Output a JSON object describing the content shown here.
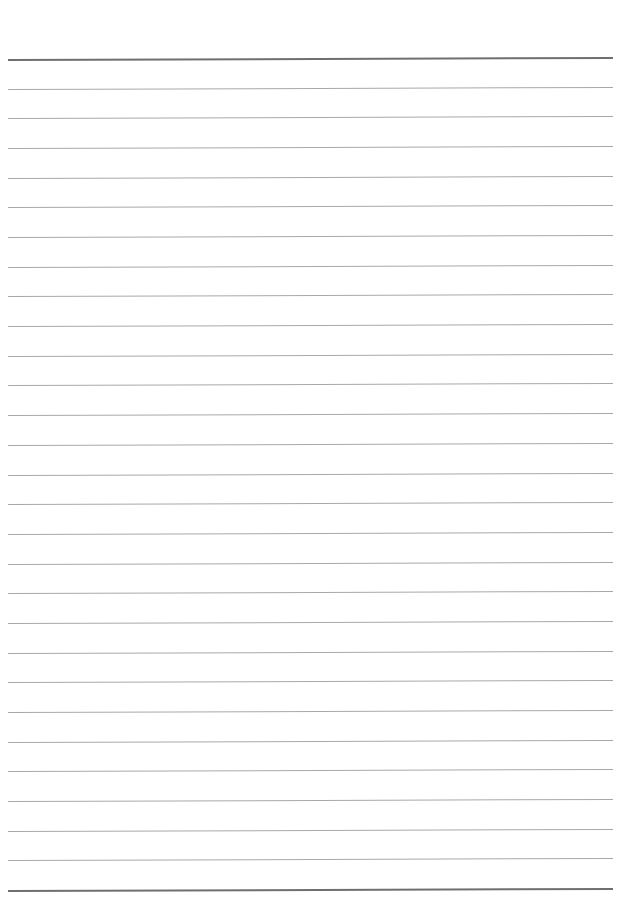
{
  "page": {
    "type": "lined-paper",
    "background": "#ffffff",
    "rule_color": "#a8a8a8",
    "heavy_rule_color": "#6f6f6f",
    "rules": {
      "count": 29,
      "first_y": 59,
      "last_y": 890,
      "left_x": 8,
      "right_x": 613,
      "heavy_indices": [
        0,
        28
      ]
    }
  }
}
